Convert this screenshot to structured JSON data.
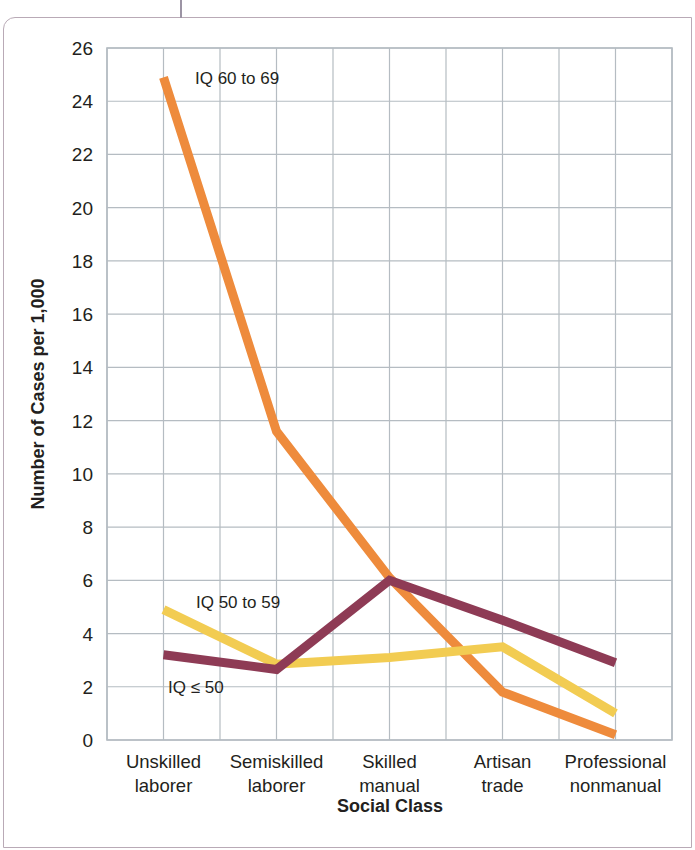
{
  "figure": {
    "frame_color": "#b9aab6",
    "background": "#ffffff"
  },
  "chart_data": {
    "type": "line",
    "title": "",
    "subtitle": "",
    "xlabel": "Social Class",
    "ylabel": "Number of Cases per 1,000",
    "categories": [
      "Unskilled laborer",
      "Semiskilled laborer",
      "Skilled manual",
      "Artisan trade",
      "Professional nonmanual"
    ],
    "category_lines": [
      [
        "Unskilled",
        "laborer"
      ],
      [
        "Semiskilled",
        "laborer"
      ],
      [
        "Skilled",
        "manual"
      ],
      [
        "Artisan",
        "trade"
      ],
      [
        "Professional",
        "nonmanual"
      ]
    ],
    "ylim": [
      0,
      26
    ],
    "ytick_step": 2,
    "yticks": [
      0,
      2,
      4,
      6,
      8,
      10,
      12,
      14,
      16,
      18,
      20,
      22,
      24,
      26
    ],
    "grid": true,
    "grid_color": "#b5bcc2",
    "legend_position": "inline-annotations",
    "series": [
      {
        "name": "IQ 60 to 69",
        "color": "#ee8b3c",
        "values": [
          24.9,
          11.6,
          6.1,
          1.8,
          0.2
        ],
        "annotation": "IQ 60 to 69"
      },
      {
        "name": "IQ 50 to 59",
        "color": "#f2cc52",
        "values": [
          4.9,
          2.85,
          3.1,
          3.5,
          1.0
        ],
        "annotation": "IQ 50 to 59"
      },
      {
        "name": "IQ ≤ 50",
        "color": "#8e3b55",
        "values": [
          3.2,
          2.65,
          6.0,
          4.5,
          2.9
        ],
        "annotation": "IQ ≤ 50"
      }
    ],
    "annotations": [
      {
        "text": "IQ 60 to 69",
        "x_px": 195,
        "y_px": 84,
        "series": "IQ 60 to 69"
      },
      {
        "text": "IQ 50 to 59",
        "x_px": 196,
        "y_px": 608,
        "series": "IQ 50 to 59"
      },
      {
        "text": "IQ ≤ 50",
        "x_px": 168,
        "y_px": 693,
        "series": "IQ ≤ 50"
      }
    ]
  }
}
